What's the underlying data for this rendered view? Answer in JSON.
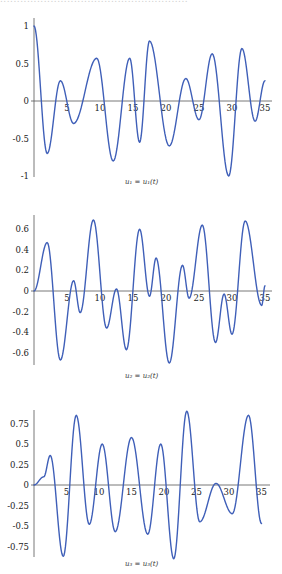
{
  "page": {
    "top_text_cropped": "........................................................"
  },
  "style": {
    "curve_color": "#3f5fb8",
    "axis_color": "#555555"
  },
  "chart_data": [
    {
      "type": "line",
      "title": "",
      "caption": "u₁ = u₁(t)",
      "xlabel": "",
      "ylabel": "",
      "xlim": [
        0,
        35
      ],
      "ylim": [
        -1.05,
        1.1
      ],
      "xticks": [
        5,
        10,
        15,
        20,
        25,
        30,
        35
      ],
      "xtick_labels": [
        "5",
        "10",
        "15",
        "20",
        "25",
        "30",
        "35"
      ],
      "yticks": [
        1,
        0.5,
        0,
        -0.5,
        -1
      ],
      "ytick_labels": [
        "1",
        "0.5",
        "0",
        "-0.5",
        "-1"
      ],
      "grid": false,
      "series": [
        {
          "name": "u1",
          "x": [
            0,
            2,
            4,
            6,
            9.5,
            12,
            14.5,
            16,
            17.5,
            20.5,
            23,
            25,
            27,
            29.5,
            31.5,
            33.5,
            35
          ],
          "y": [
            1,
            -0.7,
            0.27,
            -0.3,
            0.57,
            -0.8,
            0.57,
            -0.55,
            0.8,
            -0.6,
            0.3,
            -0.25,
            0.63,
            -1.0,
            0.7,
            -0.27,
            0.27
          ]
        }
      ]
    },
    {
      "type": "line",
      "title": "",
      "caption": "u₂ = u₂(t)",
      "xlabel": "",
      "ylabel": "",
      "xlim": [
        0,
        35
      ],
      "ylim": [
        -0.72,
        0.75
      ],
      "xticks": [
        5,
        10,
        15,
        20,
        25,
        30,
        35
      ],
      "xtick_labels": [
        "5",
        "10",
        "15",
        "20",
        "25",
        "30",
        "35"
      ],
      "yticks": [
        0.6,
        0.4,
        0.2,
        0,
        -0.2,
        -0.4,
        -0.6
      ],
      "ytick_labels": [
        "0.6",
        "0.4",
        "0.2",
        "0",
        "-0.2",
        "-0.4",
        "-0.6"
      ],
      "grid": false,
      "series": [
        {
          "name": "u2",
          "x": [
            0,
            2,
            4,
            6,
            7,
            9,
            11,
            12.5,
            14,
            16,
            17.5,
            18.5,
            20.5,
            22.5,
            23.5,
            25.5,
            27.5,
            28.8,
            30,
            32,
            34.5,
            35
          ],
          "y": [
            0,
            0.47,
            -0.67,
            0.1,
            -0.21,
            0.69,
            -0.36,
            0.02,
            -0.57,
            0.6,
            -0.05,
            0.32,
            -0.7,
            0.25,
            -0.07,
            0.64,
            -0.5,
            -0.03,
            -0.42,
            0.68,
            -0.14,
            0.05
          ]
        }
      ]
    },
    {
      "type": "line",
      "title": "",
      "caption": "u₃ = u₃(t)",
      "xlabel": "",
      "ylabel": "",
      "xlim": [
        0,
        35
      ],
      "ylim": [
        -0.9,
        0.92
      ],
      "xticks": [
        5,
        10,
        15,
        20,
        25,
        30,
        35
      ],
      "xtick_labels": [
        "5",
        "10",
        "15",
        "20",
        "25",
        "30",
        "35"
      ],
      "yticks": [
        0.75,
        0.5,
        0.25,
        0,
        -0.25,
        -0.5,
        -0.75
      ],
      "ytick_labels": [
        "0.75",
        "0.5",
        "0.25",
        "0",
        "-0.25",
        "-0.5",
        "-0.75"
      ],
      "grid": false,
      "series": [
        {
          "name": "u3",
          "x": [
            0,
            1.5,
            2.5,
            4.5,
            6.5,
            8.5,
            10.5,
            12.5,
            15,
            17.5,
            19.5,
            21.5,
            23.5,
            25.5,
            28,
            30.5,
            33,
            35
          ],
          "y": [
            0,
            0.1,
            0.36,
            -0.87,
            0.85,
            -0.48,
            0.5,
            -0.57,
            0.58,
            -0.6,
            0.5,
            -0.9,
            0.9,
            -0.45,
            0.02,
            -0.35,
            0.85,
            -0.47
          ]
        }
      ]
    }
  ]
}
